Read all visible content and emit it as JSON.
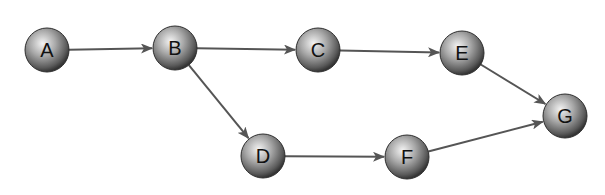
{
  "diagram": {
    "type": "directed-graph",
    "colors": {
      "edge": "#555555",
      "node_light": "#f2f2f2",
      "node_mid": "#9a9a9a",
      "node_dark": "#3c3c3c",
      "label": "#111111"
    },
    "nodes": [
      {
        "id": "A",
        "label": "A",
        "x": 47,
        "y": 50,
        "r": 22
      },
      {
        "id": "B",
        "label": "B",
        "x": 175,
        "y": 48,
        "r": 22
      },
      {
        "id": "C",
        "label": "C",
        "x": 318,
        "y": 50,
        "r": 22
      },
      {
        "id": "E",
        "label": "E",
        "x": 462,
        "y": 53,
        "r": 22
      },
      {
        "id": "G",
        "label": "G",
        "x": 565,
        "y": 116,
        "r": 22
      },
      {
        "id": "D",
        "label": "D",
        "x": 263,
        "y": 156,
        "r": 22
      },
      {
        "id": "F",
        "label": "F",
        "x": 407,
        "y": 157,
        "r": 22
      }
    ],
    "edges": [
      {
        "from": "A",
        "to": "B"
      },
      {
        "from": "B",
        "to": "C"
      },
      {
        "from": "C",
        "to": "E"
      },
      {
        "from": "E",
        "to": "G"
      },
      {
        "from": "B",
        "to": "D"
      },
      {
        "from": "D",
        "to": "F"
      },
      {
        "from": "F",
        "to": "G"
      }
    ]
  }
}
